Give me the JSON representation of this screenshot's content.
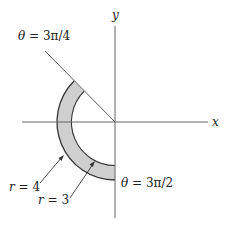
{
  "figure": {
    "type": "polar-region",
    "axes": {
      "x_label": "x",
      "y_label": "y",
      "origin_px": [
        115,
        122
      ]
    },
    "region": {
      "inner_radius_label": "r = 3",
      "outer_radius_label": "r = 4",
      "start_angle_label": "θ = 3π/4",
      "end_angle_label": "θ = 3π/2",
      "fill_color": "#cfcfcf",
      "stroke_color": "#333333"
    },
    "labels": {
      "theta_start": {
        "lhs": "θ",
        "eq": " = ",
        "rhs": "3π/4"
      },
      "theta_end": {
        "lhs": "θ",
        "eq": " = ",
        "rhs": "3π/2"
      },
      "r_outer": {
        "lhs": "r",
        "eq": " = ",
        "rhs": "4"
      },
      "r_inner": {
        "lhs": "r",
        "eq": " = ",
        "rhs": "3"
      }
    }
  }
}
